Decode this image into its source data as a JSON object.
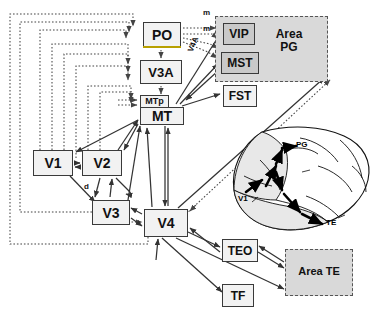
{
  "figure": {
    "type": "connectivity-diagram",
    "title_visible": false,
    "background": "#ffffff"
  },
  "colors": {
    "box_fill": "#f2f2f2",
    "box_fill_gray": "#c9c9c9",
    "box_stroke": "#3a3a3a",
    "region_fill": "#d9d9d9",
    "region_stroke": "#555555",
    "edge_solid": "#333333",
    "edge_dotted": "#444444",
    "po_underline": "#b8a000",
    "brain_fill": "#e8e8e8"
  },
  "nodes": [
    {
      "id": "PO",
      "label": "PO",
      "x": 143,
      "y": 22,
      "w": 38,
      "h": 26,
      "style": "reg",
      "fill": "#f2f2f2"
    },
    {
      "id": "V3A",
      "label": "V3A",
      "x": 140,
      "y": 60,
      "w": 42,
      "h": 24,
      "style": "reg",
      "fill": "#f2f2f2"
    },
    {
      "id": "MTp",
      "label": "MTp",
      "x": 140,
      "y": 96,
      "w": 29,
      "h": 13,
      "style": "small",
      "fill": "#f2f2f2"
    },
    {
      "id": "MT",
      "label": "MT",
      "x": 140,
      "y": 107,
      "w": 44,
      "h": 17,
      "style": "reg",
      "fill": "#f2f2f2"
    },
    {
      "id": "VIP",
      "label": "VIP",
      "x": 223,
      "y": 23,
      "w": 32,
      "h": 22,
      "style": "reg",
      "fill": "#c9c9c9"
    },
    {
      "id": "MST",
      "label": "MST",
      "x": 221,
      "y": 52,
      "w": 38,
      "h": 22,
      "style": "reg",
      "fill": "#c9c9c9"
    },
    {
      "id": "FST",
      "label": "FST",
      "x": 223,
      "y": 85,
      "w": 34,
      "h": 22,
      "style": "reg",
      "fill": "#f2f2f2"
    },
    {
      "id": "V1",
      "label": "V1",
      "x": 33,
      "y": 150,
      "w": 40,
      "h": 26,
      "style": "reg",
      "fill": "#f2f2f2"
    },
    {
      "id": "V2",
      "label": "V2",
      "x": 82,
      "y": 150,
      "w": 40,
      "h": 26,
      "style": "reg",
      "fill": "#f2f2f2"
    },
    {
      "id": "V3",
      "label": "V3",
      "x": 92,
      "y": 200,
      "w": 38,
      "h": 25,
      "style": "reg",
      "fill": "#f2f2f2"
    },
    {
      "id": "V4",
      "label": "V4",
      "x": 144,
      "y": 209,
      "w": 44,
      "h": 28,
      "style": "reg",
      "fill": "#f2f2f2"
    },
    {
      "id": "TEO",
      "label": "TEO",
      "x": 222,
      "y": 239,
      "w": 36,
      "h": 23,
      "style": "reg",
      "fill": "#f2f2f2"
    },
    {
      "id": "TF",
      "label": "TF",
      "x": 222,
      "y": 284,
      "w": 32,
      "h": 23,
      "style": "reg",
      "fill": "#f2f2f2"
    }
  ],
  "regions": [
    {
      "id": "AreaPG",
      "label_line1": "Area",
      "label_line2": "PG",
      "x": 215,
      "y": 16,
      "w": 113,
      "h": 66,
      "label_x": 268,
      "label_y": 32,
      "font_size": 12
    },
    {
      "id": "AreaTE",
      "label_line1": "Area TE",
      "label_line2": "",
      "x": 285,
      "y": 249,
      "w": 68,
      "h": 47,
      "label_x": 295,
      "label_y": 264,
      "font_size": 11
    }
  ],
  "edge_labels": [
    {
      "id": "m-upper",
      "text": "m",
      "x": 205,
      "y": 14,
      "size": 8
    },
    {
      "id": "m-lower",
      "text": "m",
      "x": 205,
      "y": 28,
      "size": 8
    },
    {
      "id": "d-label",
      "text": "d",
      "x": 85,
      "y": 186,
      "size": 8
    },
    {
      "id": "v4a-rot",
      "text": "V4A",
      "x": 184,
      "y": 46,
      "size": 7
    }
  ],
  "brain_inset": {
    "labels": [
      {
        "text": "V1",
        "x": 241,
        "y": 198
      },
      {
        "text": "PG",
        "x": 287,
        "y": 171
      },
      {
        "text": "TE",
        "x": 329,
        "y": 220
      }
    ],
    "bounds": {
      "x": 228,
      "y": 128,
      "w": 145,
      "h": 104
    }
  },
  "node_descriptions": {
    "PO": "parieto-occipital area",
    "V3A": "visual area V3A",
    "MTp": "MT peripheral",
    "MT": "middle temporal area",
    "VIP": "ventral intraparietal area",
    "MST": "medial superior temporal area",
    "FST": "fundus of superior temporal area",
    "V1": "primary visual cortex",
    "V2": "visual area V2",
    "V3": "visual area V3",
    "V4": "visual area V4",
    "TEO": "temporal occipital area",
    "TF": "area TF"
  }
}
